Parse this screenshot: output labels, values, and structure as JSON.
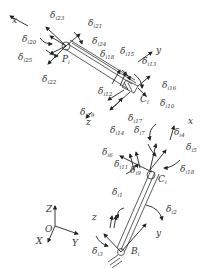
{
  "diagram": {
    "type": "kinematic-chain-error-diagram",
    "points": {
      "P": "P",
      "P_sub": "i",
      "C": "C",
      "C_sub": "i",
      "B": "B",
      "B_sub": "i",
      "O": "O"
    },
    "global_axes": {
      "Z": "Z",
      "X": "X",
      "Y": "Y"
    },
    "upper_frame_axes": {
      "x": "x",
      "y": "y",
      "z": "z"
    },
    "lower_frame_axes": {
      "x": "x",
      "y": "y",
      "z": "z"
    },
    "delta_symbol": "δ",
    "labels_upper": [
      {
        "sub": "i23"
      },
      {
        "sub": "i21"
      },
      {
        "sub": "i20"
      },
      {
        "sub": "i24"
      },
      {
        "sub": "i25"
      },
      {
        "sub": "i18"
      },
      {
        "sub": "i15"
      },
      {
        "sub": "i13"
      },
      {
        "sub": "i22"
      },
      {
        "sub": "i16"
      },
      {
        "sub": "i12"
      },
      {
        "sub": "i10"
      },
      {
        "sub": "i19"
      },
      {
        "sub": "i17"
      },
      {
        "sub": "i14"
      }
    ],
    "labels_lower": [
      {
        "sub": "i7"
      },
      {
        "sub": "i4"
      },
      {
        "sub": "i6"
      },
      {
        "sub": "i5"
      },
      {
        "sub": "i11"
      },
      {
        "sub": "i9"
      },
      {
        "sub": "i18"
      },
      {
        "sub": "i1"
      },
      {
        "sub": "i2"
      },
      {
        "sub": "i3"
      }
    ]
  }
}
